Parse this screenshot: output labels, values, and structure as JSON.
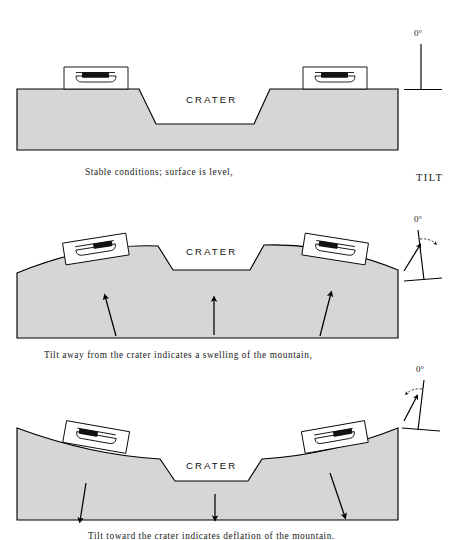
{
  "figure": {
    "title_word": "TILT",
    "crater_label": "CRATER",
    "degree_label": "0°",
    "fill_color": "#d6d6d6",
    "line_color": "#000000",
    "background": "#ffffff"
  },
  "panels": [
    {
      "id": "panel-stable",
      "index": 1,
      "caption": "Stable conditions; surface is level,",
      "crater_label": "CRATER",
      "state": "level",
      "tilt_indicator": {
        "degree_label": "0°",
        "direction": "vertical",
        "has_arrow": false,
        "has_arc": false
      },
      "arrows": [],
      "instruments": [
        {
          "side": "left",
          "tilt_deg": 0
        },
        {
          "side": "right",
          "tilt_deg": 0
        }
      ]
    },
    {
      "id": "panel-swelling",
      "index": 2,
      "caption": "Tilt away from the crater indicates a swelling of the mountain,",
      "crater_label": "CRATER",
      "state": "swelling",
      "tilt_indicator": {
        "degree_label": "0°",
        "direction": "right",
        "has_arrow": true,
        "has_arc": true
      },
      "arrows": [
        {
          "position": "left",
          "direction": "up"
        },
        {
          "position": "center",
          "direction": "up"
        },
        {
          "position": "right",
          "direction": "up"
        }
      ],
      "instruments": [
        {
          "side": "left",
          "tilt_deg": -9
        },
        {
          "side": "right",
          "tilt_deg": 9
        }
      ]
    },
    {
      "id": "panel-subsiding",
      "index": 3,
      "caption": "Tilt toward the crater indicates deflation of the mountain.",
      "crater_label": "CRATER",
      "state": "subsiding",
      "tilt_indicator": {
        "degree_label": "0°",
        "direction": "left",
        "has_arrow": true,
        "has_arc": true
      },
      "arrows": [
        {
          "position": "left",
          "direction": "down"
        },
        {
          "position": "center",
          "direction": "down"
        },
        {
          "position": "right",
          "direction": "down"
        }
      ],
      "instruments": [
        {
          "side": "left",
          "tilt_deg": 10
        },
        {
          "side": "right",
          "tilt_deg": -10
        }
      ]
    }
  ]
}
